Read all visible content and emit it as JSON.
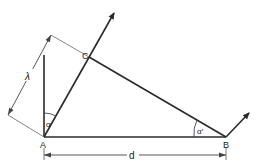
{
  "diagram": {
    "type": "geometry",
    "points": {
      "A": {
        "label": "A",
        "x": 44,
        "y": 137
      },
      "B": {
        "label": "B",
        "x": 226,
        "y": 137
      },
      "C": {
        "label": "C",
        "x": 89,
        "y": 57
      }
    },
    "labels": {
      "lambda": "λ",
      "d": "d",
      "alpha": "α",
      "alpha_prime": "α′"
    },
    "colors": {
      "line": "#2a2a2a",
      "thin_line": "#555555",
      "background": "#ffffff"
    }
  }
}
